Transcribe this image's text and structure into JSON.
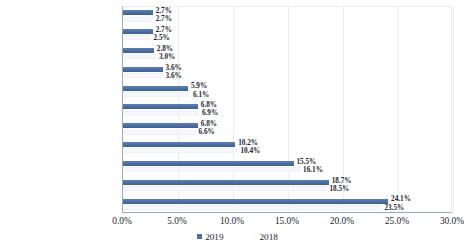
{
  "chart_data": {
    "type": "bar",
    "orientation": "horizontal",
    "title": "",
    "subtitle": "",
    "xlabel": "",
    "ylabel": "",
    "xlim": [
      0,
      30
    ],
    "xtick_labels": [
      "0.0%",
      "5.0%",
      "10.0%",
      "15.0%",
      "20.0%",
      "25.0%",
      "30.0%"
    ],
    "xtick_values": [
      0,
      5,
      10,
      15,
      20,
      25,
      30
    ],
    "grid": true,
    "grid_axis": "x",
    "legend_position": "bottom",
    "value_labels": true,
    "value_label_suffix": "%",
    "categories": [
      "能源",
      "金融",
      "通信服务",
      "公用事业",
      "房地产",
      "医疗保健",
      "日常消费品",
      "信息技术",
      "非日常生活消费品",
      "原材料",
      "工业"
    ],
    "series": [
      {
        "name": "2019",
        "color": "#4a6fa5",
        "values": [
          2.7,
          2.7,
          2.8,
          3.6,
          5.9,
          6.8,
          6.8,
          10.2,
          15.5,
          18.7,
          24.1
        ],
        "labels": [
          "2.7%",
          "2.7%",
          "2.8%",
          "3.6%",
          "5.9%",
          "6.8%",
          "6.8%",
          "10.2%",
          "15.5%",
          "18.7%",
          "24.1%"
        ]
      },
      {
        "name": "2018",
        "color": "#f4f7fb",
        "values": [
          2.7,
          2.5,
          3.0,
          3.6,
          6.1,
          6.9,
          6.6,
          10.4,
          16.1,
          18.5,
          23.5
        ],
        "labels": [
          "2.7%",
          "2.5%",
          "3.0%",
          "3.6%",
          "6.1%",
          "6.9%",
          "6.6%",
          "10.4%",
          "16.1%",
          "18.5%",
          "23.5%"
        ]
      }
    ]
  },
  "legend": {
    "items": [
      {
        "label": "2019"
      },
      {
        "label": "2018"
      }
    ]
  }
}
